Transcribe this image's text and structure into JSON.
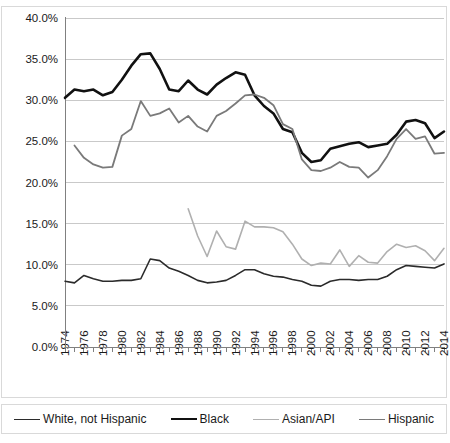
{
  "chart_data": {
    "type": "line",
    "title": "",
    "xlabel": "",
    "ylabel": "",
    "ylim": [
      0,
      0.4
    ],
    "xlim": [
      1974,
      2014
    ],
    "grid": true,
    "legend_position": "bottom",
    "y_ticks": [
      "0.0%",
      "5.0%",
      "10.0%",
      "15.0%",
      "20.0%",
      "25.0%",
      "30.0%",
      "35.0%",
      "40.0%"
    ],
    "y_tick_values": [
      0,
      5,
      10,
      15,
      20,
      25,
      30,
      35,
      40
    ],
    "x_ticks": [
      "1974",
      "1976",
      "1978",
      "1980",
      "1982",
      "1984",
      "1986",
      "1988",
      "1990",
      "1992",
      "1994",
      "1996",
      "1998",
      "2000",
      "2002",
      "2004",
      "2006",
      "2008",
      "2010",
      "2012",
      "2014"
    ],
    "x_all_years": [
      1974,
      1975,
      1976,
      1977,
      1978,
      1979,
      1980,
      1981,
      1982,
      1983,
      1984,
      1985,
      1986,
      1987,
      1988,
      1989,
      1990,
      1991,
      1992,
      1993,
      1994,
      1995,
      1996,
      1997,
      1998,
      1999,
      2000,
      2001,
      2002,
      2003,
      2004,
      2005,
      2006,
      2007,
      2008,
      2009,
      2010,
      2011,
      2012,
      2013,
      2014
    ],
    "series": [
      {
        "name": "White, not Hispanic",
        "color": "#2b2b2b",
        "width": 1.6,
        "x": [
          1974,
          1975,
          1976,
          1977,
          1978,
          1979,
          1980,
          1981,
          1982,
          1983,
          1984,
          1985,
          1986,
          1987,
          1988,
          1989,
          1990,
          1991,
          1992,
          1993,
          1994,
          1995,
          1996,
          1997,
          1998,
          1999,
          2000,
          2001,
          2002,
          2003,
          2004,
          2005,
          2006,
          2007,
          2008,
          2009,
          2010,
          2011,
          2012,
          2013,
          2014
        ],
        "values": [
          8.0,
          7.8,
          8.7,
          8.3,
          8.0,
          8.0,
          8.1,
          8.1,
          8.3,
          10.7,
          10.5,
          9.6,
          9.2,
          8.7,
          8.1,
          7.8,
          7.9,
          8.1,
          8.7,
          9.4,
          9.4,
          8.9,
          8.6,
          8.5,
          8.2,
          8.0,
          7.5,
          7.4,
          8.0,
          8.2,
          8.2,
          8.1,
          8.2,
          8.2,
          8.6,
          9.4,
          9.9,
          9.8,
          9.7,
          9.6,
          10.1
        ]
      },
      {
        "name": "Black",
        "color": "#111111",
        "width": 2.6,
        "x": [
          1974,
          1975,
          1976,
          1977,
          1978,
          1979,
          1980,
          1981,
          1982,
          1983,
          1984,
          1985,
          1986,
          1987,
          1988,
          1989,
          1990,
          1991,
          1992,
          1993,
          1994,
          1995,
          1996,
          1997,
          1998,
          1999,
          2000,
          2001,
          2002,
          2003,
          2004,
          2005,
          2006,
          2007,
          2008,
          2009,
          2010,
          2011,
          2012,
          2013,
          2014
        ],
        "values": [
          30.3,
          31.3,
          31.1,
          31.3,
          30.6,
          31.0,
          32.5,
          34.2,
          35.6,
          35.7,
          33.8,
          31.3,
          31.1,
          32.4,
          31.3,
          30.7,
          31.9,
          32.7,
          33.4,
          33.1,
          30.6,
          29.3,
          28.4,
          26.5,
          26.1,
          23.6,
          22.5,
          22.7,
          24.1,
          24.4,
          24.7,
          24.9,
          24.3,
          24.5,
          24.7,
          25.8,
          27.4,
          27.6,
          27.2,
          25.4,
          26.2
        ]
      },
      {
        "name": "Asian/API",
        "color": "#b0b0b0",
        "width": 1.6,
        "x": [
          1987,
          1988,
          1989,
          1990,
          1991,
          1992,
          1993,
          1994,
          1995,
          1996,
          1997,
          1998,
          1999,
          2000,
          2001,
          2002,
          2003,
          2004,
          2005,
          2006,
          2007,
          2008,
          2009,
          2010,
          2011,
          2012,
          2013,
          2014
        ],
        "values": [
          16.8,
          13.5,
          11.0,
          14.1,
          12.2,
          11.9,
          15.3,
          14.6,
          14.6,
          14.5,
          14.0,
          12.5,
          10.7,
          9.9,
          10.2,
          10.1,
          11.8,
          9.8,
          11.1,
          10.3,
          10.2,
          11.6,
          12.5,
          12.1,
          12.3,
          11.7,
          10.5,
          12.0
        ]
      },
      {
        "name": "Hispanic",
        "color": "#7a7a7a",
        "width": 1.8,
        "x": [
          1975,
          1976,
          1977,
          1978,
          1979,
          1980,
          1981,
          1982,
          1983,
          1984,
          1985,
          1986,
          1987,
          1988,
          1989,
          1990,
          1991,
          1992,
          1993,
          1994,
          1995,
          1996,
          1997,
          1998,
          1999,
          2000,
          2001,
          2002,
          2003,
          2004,
          2005,
          2006,
          2007,
          2008,
          2009,
          2010,
          2011,
          2012,
          2013,
          2014
        ],
        "values": [
          24.5,
          23.0,
          22.2,
          21.8,
          21.9,
          25.7,
          26.5,
          29.9,
          28.1,
          28.4,
          29.0,
          27.3,
          28.1,
          26.8,
          26.2,
          28.1,
          28.7,
          29.6,
          30.6,
          30.7,
          30.3,
          29.4,
          27.1,
          26.5,
          22.8,
          21.5,
          21.4,
          21.8,
          22.5,
          21.9,
          21.8,
          20.6,
          21.5,
          23.2,
          25.3,
          26.5,
          25.3,
          25.6,
          23.5,
          23.6
        ]
      }
    ]
  },
  "legend": {
    "entries": [
      {
        "label": "White, not Hispanic",
        "color": "#2b2b2b",
        "width": 1.6
      },
      {
        "label": "Black",
        "color": "#111111",
        "width": 2.6
      },
      {
        "label": "Asian/API",
        "color": "#b0b0b0",
        "width": 1.6
      },
      {
        "label": "Hispanic",
        "color": "#7a7a7a",
        "width": 1.8
      }
    ]
  }
}
